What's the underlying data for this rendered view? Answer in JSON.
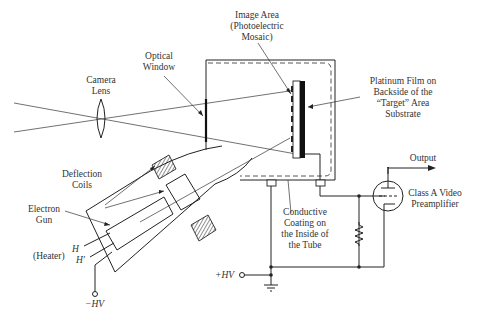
{
  "diagram": {
    "type": "vidicon-camera-tube-schematic",
    "labels": {
      "camera_lens": [
        "Camera",
        "Lens"
      ],
      "optical_window": [
        "Optical",
        "Window"
      ],
      "image_area": [
        "Image Area",
        "(Photoelectric",
        "Mosaic)"
      ],
      "platinum_film": [
        "Platinum Film on",
        "Backside of the",
        "“Target” Area",
        "Substrate"
      ],
      "output": "Output",
      "preamp": [
        "Class A Video",
        "Preamplifier"
      ],
      "deflection_coils": [
        "Deflection",
        "Coils"
      ],
      "electron_gun": [
        "Electron",
        "Gun"
      ],
      "heater_h": "H",
      "heater_h_prime": "H′",
      "heater": "(Heater)",
      "conductive_coating": [
        "Conductive",
        "Coating on",
        "the Inside of",
        "the Tube"
      ],
      "plus_hv": "+HV",
      "minus_hv": "−HV"
    },
    "colors": {
      "line": "#222222",
      "text": "#333333",
      "background": "#ffffff"
    }
  }
}
